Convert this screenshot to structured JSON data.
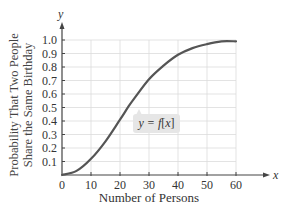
{
  "chart_data": {
    "type": "line",
    "title": "",
    "xlabel": "Number of Persons",
    "ylabel_lines": [
      "Probability That Two People",
      "Share the Same Birthday"
    ],
    "x_axis_symbol": "x",
    "y_axis_symbol": "y",
    "xlim": [
      0,
      60
    ],
    "ylim": [
      0,
      1.0
    ],
    "x_ticks": [
      "0",
      "10",
      "20",
      "30",
      "40",
      "50",
      "60"
    ],
    "y_ticks": [
      "0.1",
      "0.2",
      "0.3",
      "0.4",
      "0.5",
      "0.6",
      "0.7",
      "0.8",
      "0.9",
      "1.0"
    ],
    "grid": true,
    "series": [
      {
        "name": "y = f(x)",
        "x": [
          0,
          5,
          10,
          15,
          20,
          23,
          25,
          30,
          35,
          40,
          45,
          50,
          55,
          60
        ],
        "values": [
          0,
          0.03,
          0.12,
          0.25,
          0.41,
          0.51,
          0.57,
          0.71,
          0.81,
          0.89,
          0.94,
          0.97,
          0.99,
          0.99
        ]
      }
    ],
    "annotation": {
      "text": "y = f(x)",
      "prefix": "y = ",
      "func": "f",
      "arg": "x"
    }
  }
}
